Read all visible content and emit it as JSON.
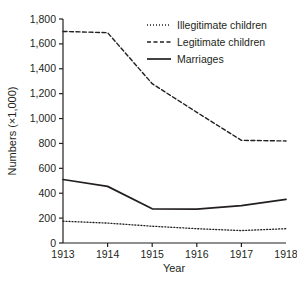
{
  "chart_data": {
    "type": "line",
    "title": "",
    "subtitle": "",
    "xlabel": "Year",
    "ylabel": "Numbers (×1,000)",
    "x": [
      1913,
      1914,
      1915,
      1916,
      1917,
      1918
    ],
    "xtick_labels": [
      "1913",
      "1914",
      "1915",
      "1916",
      "1917",
      "1918"
    ],
    "ytick_labels": [
      "0",
      "200",
      "400",
      "600",
      "800",
      "1,000",
      "1,200",
      "1,400",
      "1,600",
      "1,800"
    ],
    "ytick_values": [
      0,
      200,
      400,
      600,
      800,
      1000,
      1200,
      1400,
      1600,
      1800
    ],
    "xlim": [
      1913,
      1918
    ],
    "ylim": [
      0,
      1800
    ],
    "grid": false,
    "legend_position": "top-right",
    "series": [
      {
        "name": "Illegitimate children",
        "style": "dotted",
        "color": "#231f20",
        "values": [
          175,
          160,
          135,
          115,
          100,
          115
        ]
      },
      {
        "name": "Legitimate children",
        "style": "dashed",
        "color": "#231f20",
        "values": [
          1700,
          1690,
          1280,
          1050,
          825,
          820
        ]
      },
      {
        "name": "Marriages",
        "style": "solid",
        "color": "#231f20",
        "values": [
          510,
          455,
          275,
          273,
          300,
          350
        ]
      }
    ]
  },
  "axes": {
    "x_axis_label": "Year",
    "y_axis_label": "Numbers (×1,000)"
  },
  "legend": {
    "entries": [
      {
        "label": "Illegitimate children",
        "style": "dotted"
      },
      {
        "label": "Legitimate children",
        "style": "dashed"
      },
      {
        "label": "Marriages",
        "style": "solid"
      }
    ]
  },
  "colors": {
    "ink": "#231f20",
    "background": "#ffffff"
  }
}
